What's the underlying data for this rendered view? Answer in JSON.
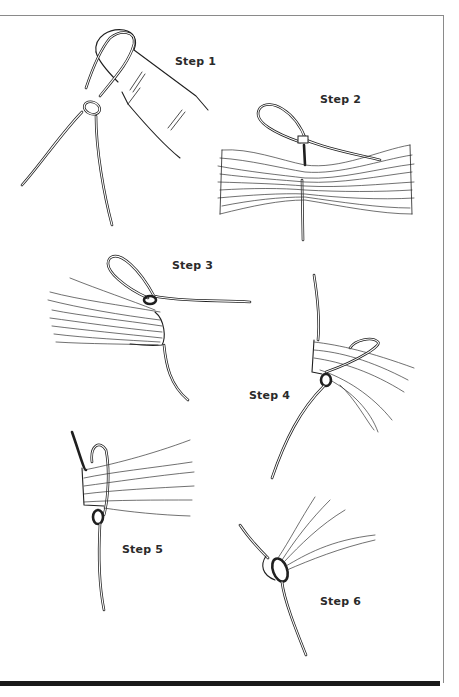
{
  "figure": {
    "steps": [
      {
        "label": "Step 1",
        "x": 175,
        "y": 55
      },
      {
        "label": "Step 2",
        "x": 320,
        "y": 93
      },
      {
        "label": "Step 3",
        "x": 172,
        "y": 259
      },
      {
        "label": "Step 4",
        "x": 249,
        "y": 389
      },
      {
        "label": "Step 5",
        "x": 122,
        "y": 543
      },
      {
        "label": "Step 6",
        "x": 320,
        "y": 595
      }
    ]
  },
  "colors": {
    "line": "#1f1f1f",
    "frame": "#8a8a8a",
    "bottom_bar": "#1a1a1a",
    "background": "#ffffff"
  }
}
